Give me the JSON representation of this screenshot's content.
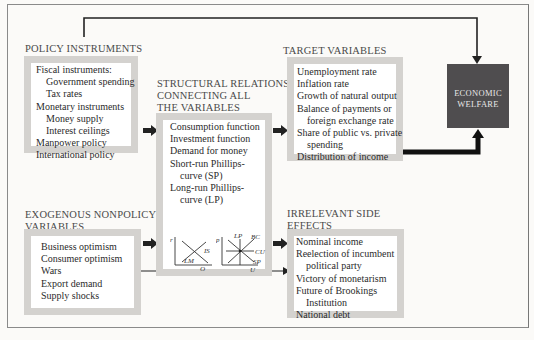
{
  "policy_instruments": {
    "heading": "POLICY INSTRUMENTS",
    "items": [
      {
        "text": "Fiscal instruments:",
        "indent": 0
      },
      {
        "text": "Government spending",
        "indent": 1
      },
      {
        "text": "Tax rates",
        "indent": 1
      },
      {
        "text": "Monetary instruments",
        "indent": 0
      },
      {
        "text": "Money supply",
        "indent": 1
      },
      {
        "text": "Interest ceilings",
        "indent": 1
      },
      {
        "text": "Manpower policy",
        "indent": 0
      },
      {
        "text": "International policy",
        "indent": 0
      }
    ]
  },
  "structural_relations": {
    "heading_line1": "STRUCTURAL RELATIONS",
    "heading_line2": "CONNECTING ALL",
    "heading_line3": "THE VARIABLES",
    "items": [
      {
        "text": "Consumption function",
        "indent": 0
      },
      {
        "text": "Investment function",
        "indent": 0
      },
      {
        "text": "Demand for money",
        "indent": 0
      },
      {
        "text": "Short-run Phillips-",
        "indent": 0
      },
      {
        "text": "curve (SP)",
        "indent": 1
      },
      {
        "text": "Long-run Phillips-",
        "indent": 0
      },
      {
        "text": "curve (LP)",
        "indent": 1
      }
    ],
    "islm_graph": {
      "y_axis": "r",
      "x_axis": "Q",
      "curve1": "IS",
      "curve2": "LM"
    },
    "phillips_graph": {
      "y_axis": "p",
      "x_axis": "U",
      "curves": [
        "LP",
        "BC",
        "CU",
        "SP"
      ]
    }
  },
  "target_variables": {
    "heading": "TARGET VARIABLES",
    "items": [
      {
        "text": "Unemployment rate",
        "indent": 0
      },
      {
        "text": "Inflation rate",
        "indent": 0
      },
      {
        "text": "Growth of natural output",
        "indent": 0
      },
      {
        "text": "Balance of payments or",
        "indent": 0
      },
      {
        "text": "foreign exchange rate",
        "indent": 1
      },
      {
        "text": "Share of public vs. private",
        "indent": 0
      },
      {
        "text": "spending",
        "indent": 1
      },
      {
        "text": "Distribution of income",
        "indent": 0
      }
    ]
  },
  "economic_welfare": {
    "line1": "ECONOMIC",
    "line2": "WELFARE",
    "color": "#4f4d4f"
  },
  "exogenous": {
    "heading_line1": "EXOGENOUS NONPOLICY",
    "heading_line2": "VARIABLES",
    "items": [
      {
        "text": "Business optimism",
        "indent": 0
      },
      {
        "text": "Consumer optimism",
        "indent": 0
      },
      {
        "text": "Wars",
        "indent": 0
      },
      {
        "text": "Export demand",
        "indent": 0
      },
      {
        "text": "Supply shocks",
        "indent": 0
      }
    ]
  },
  "irrelevant": {
    "heading_line1": "IRRELEVANT SIDE",
    "heading_line2": "EFFECTS",
    "items": [
      {
        "text": "Nominal income",
        "indent": 0
      },
      {
        "text": "Reelection of incumbent",
        "indent": 0
      },
      {
        "text": "political party",
        "indent": 1
      },
      {
        "text": "Victory of monetarism",
        "indent": 0
      },
      {
        "text": "Future of Brookings",
        "indent": 0
      },
      {
        "text": "Institution",
        "indent": 1
      },
      {
        "text": "National debt",
        "indent": 0
      }
    ]
  }
}
